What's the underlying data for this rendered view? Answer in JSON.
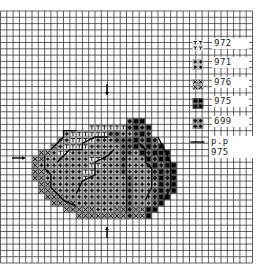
{
  "chart": {
    "title": "",
    "grid": {
      "cols": 40,
      "rows": 40,
      "originX": 0.5,
      "originY": 11,
      "cell": 6.3,
      "line_color": "#3a3a3a",
      "bold_every": 0
    },
    "center_arrows": {
      "top": {
        "x": 107,
        "y": 90,
        "glyph": "↓"
      },
      "bottom": {
        "x": 107,
        "y": 232,
        "glyph": "↑"
      },
      "left": {
        "x": 19,
        "y": 158,
        "glyph": "→"
      },
      "right_note": "p.p 975"
    }
  },
  "legend": [
    {
      "symbol": "T",
      "name": "legend-972",
      "dmc": "972",
      "y": 47
    },
    {
      "symbol": "plus-dots",
      "name": "legend-971",
      "dmc": "971",
      "y": 66
    },
    {
      "symbol": "x",
      "name": "legend-976",
      "dmc": "976",
      "y": 86
    },
    {
      "symbol": "square",
      "name": "legend-975",
      "dmc": "975",
      "y": 105
    },
    {
      "symbol": "diamond-dots",
      "name": "legend-699",
      "dmc": "699",
      "y": 125
    },
    {
      "symbol": "line",
      "name": "legend-backstitch-975",
      "dmc": "p.p 975",
      "y": 145
    }
  ],
  "motif": {
    "description": "pumpkin",
    "rows": [
      "........................................",
      "........................................",
      "........................................",
      "........................................",
      "........................................",
      "........................................",
      "........................................",
      "........................................",
      "........................................",
      "........................................",
      "........................................",
      "........................................",
      "........................................",
      "........................................",
      "........................................",
      "........................................",
      "........................................",
      "....................DSS.................",
      "..............TTTTTTDSDS................",
      "..........PTTTTTTDDPPDSD................",
      ".........PPTTTTPPPDDDSDSD...............",
      "........XPTTTTPPPPPDDSDSDS..............",
      "......XXPTTPPPPPPPPDDPSDSSS.............",
      ".....XXPPPPPPPTTPPPDPPPSDSS.............",
      ".....XPPPPPPPPTTPPPDPPPDSDSS............",
      ".....XXPPPPPPTTPPPPDPPPPDSDS............",
      ".....XXPPPPPPTPPPPPPDPPPDSDS............",
      "......XXPPPPPPPPPPPPDPPPPSDS............",
      "......XXXPPPPPPPPPPPDPPPDSDS............",
      ".......XXXPPPPPPPPPPDPPPDSS.............",
      "........XXXXPPPPPPPPDPPPDS..............",
      "..........XXXXXPPPXXDXXSS...............",
      "............XXXXXXXXDXXS................",
      "........................................",
      "........................................",
      "........................................",
      "........................................",
      "........................................",
      "........................................",
      "........................................"
    ],
    "key": {
      "T": "972",
      "P": "971",
      "X": "976",
      "S": "975",
      "D": "699"
    }
  }
}
